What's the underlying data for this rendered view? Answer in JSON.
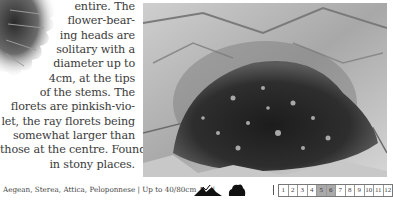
{
  "text": {
    "lines": [
      "entire.  The",
      "flower-bear-",
      "ing heads are",
      "solitary with a",
      "diameter up to",
      "4cm, at the tips",
      "of the stems. The",
      "florets are pinkish-vio-",
      "let, the ray florets being",
      "somewhat larger than",
      "those at the centre. Found",
      "in stony places."
    ]
  },
  "images": {
    "leaf": "flower-leaf-illustration",
    "photo": "cushion-plant-on-stony-ground-photo"
  },
  "footer": {
    "distribution": "Aegean, Sterea, Attica, Peloponnese",
    "separator": "|",
    "height": "Up to 40/80cm",
    "arrows": "↑→",
    "habitat_icons": [
      "mountain-icon",
      "shrub-icon"
    ],
    "months": [
      "1",
      "2",
      "3",
      "4",
      "5",
      "6",
      "7",
      "8",
      "9",
      "10",
      "11",
      "12"
    ],
    "flowering_months": [
      "5",
      "6"
    ],
    "highlight_color": "#aaaaaa"
  }
}
